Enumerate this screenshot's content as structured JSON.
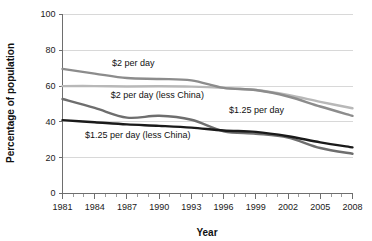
{
  "chart_data": {
    "type": "line",
    "title": "",
    "xlabel": "Year",
    "ylabel": "Percentage of population",
    "xlim": [
      1981,
      2008
    ],
    "ylim": [
      0,
      100
    ],
    "grid": true,
    "legend": "inline-annotations",
    "x": [
      1981,
      1984,
      1987,
      1990,
      1993,
      1996,
      1999,
      2002,
      2005,
      2008
    ],
    "x_ticklabels": [
      "1981",
      "1984",
      "1987",
      "1990",
      "1993",
      "1996",
      "1999",
      "2002",
      "2005",
      "2008"
    ],
    "y_ticklabels": [
      "0",
      "20",
      "40",
      "60",
      "80",
      "100"
    ],
    "y_ticks": [
      0,
      20,
      40,
      60,
      80,
      100
    ],
    "series": [
      {
        "name": "$2 per day",
        "color": "#8c8c8c",
        "width": 2.4,
        "values": [
          69.6,
          67.0,
          64.5,
          64.0,
          63.2,
          59.0,
          57.8,
          54.2,
          48.6,
          43.4
        ],
        "label": "$2 per day",
        "label_x": 1985.6,
        "label_y": 71.5
      },
      {
        "name": "$2 per day (less China)",
        "color": "#b8b8b8",
        "width": 2.4,
        "values": [
          60.0,
          60.0,
          59.8,
          59.9,
          59.7,
          59.0,
          57.8,
          55.0,
          51.2,
          47.6
        ],
        "label": "$2 per day (less China)",
        "label_x": 1985.5,
        "label_y": 53.5
      },
      {
        "name": "$1.25 per day",
        "color": "#6e6e6e",
        "width": 2.4,
        "values": [
          52.8,
          47.8,
          42.4,
          43.4,
          41.2,
          34.8,
          33.4,
          31.2,
          25.4,
          22.2
        ],
        "label": "$1.25 per day",
        "label_x": 1996.5,
        "label_y": 45.2
      },
      {
        "name": "$1.25 per day (less China)",
        "color": "#1a1a1a",
        "width": 2.4,
        "values": [
          41.0,
          39.8,
          38.6,
          37.8,
          36.8,
          35.2,
          34.4,
          32.0,
          28.6,
          25.8
        ],
        "label": "$1.25 per day (less China)",
        "label_x": 1983.1,
        "label_y": 30.9
      }
    ]
  }
}
